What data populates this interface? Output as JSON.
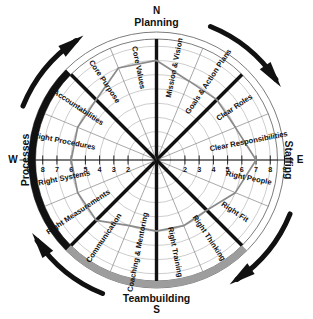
{
  "compass": {
    "north": {
      "cardinal": "N",
      "label": "Planning"
    },
    "east": {
      "cardinal": "E",
      "label": "Staffing"
    },
    "south": {
      "cardinal": "S",
      "label": "Teambuilding"
    },
    "west": {
      "cardinal": "W",
      "label": "Processes"
    }
  },
  "arrows": [
    {
      "name": "planning-to-staffing-arrow",
      "position": "top-right"
    },
    {
      "name": "staffing-to-teambuilding-arrow",
      "position": "right-bottom"
    },
    {
      "name": "teambuilding-to-processes-arrow",
      "position": "bottom-left"
    },
    {
      "name": "processes-to-planning-arrow",
      "position": "left-top"
    }
  ],
  "axis": {
    "left_ticks": [
      "9",
      "8",
      "7",
      "6",
      "5",
      "4",
      "3",
      "2"
    ],
    "right_ticks": [
      "2",
      "3",
      "4",
      "5",
      "6",
      "7",
      "8",
      "9"
    ],
    "scale_min": 1,
    "scale_max": 9
  },
  "emphasis_arcs": [
    {
      "name": "processes-arc",
      "quadrant": "west",
      "color": "#111111"
    },
    {
      "name": "teambuilding-arc",
      "quadrant": "south",
      "color": "#9d9d9d"
    }
  ],
  "chart_data": {
    "type": "radar",
    "xlabel": "",
    "ylabel": "",
    "ylim": [
      0,
      9
    ],
    "grid": true,
    "legend": "none",
    "axis_ranges": {
      "min": 1,
      "max": 9
    },
    "quadrants": [
      "Planning",
      "Staffing",
      "Teambuilding",
      "Processes"
    ],
    "categories": [
      "Mission & Vision",
      "Goals & Action Plans",
      "Clear Roles",
      "Clear Responsibilities",
      "Right People",
      "Right Fit",
      "Right Thinking",
      "Right Training",
      "Coaching & Mentoring",
      "Communication",
      "Right Measurements",
      "Right Systems",
      "Right Procedures",
      "Accountabilities",
      "Core Purpose",
      "Core Values"
    ],
    "values": [
      7,
      6,
      6,
      6,
      7,
      6,
      5,
      5,
      5,
      5,
      6,
      6,
      6,
      6,
      6,
      7
    ],
    "series": [
      {
        "name": "Current Assessment",
        "values": [
          7,
          6,
          6,
          6,
          7,
          6,
          5,
          5,
          5,
          5,
          6,
          6,
          6,
          6,
          6,
          7
        ],
        "color": "#8a8a8a"
      }
    ]
  },
  "sectors": [
    {
      "label": "Mission & Vision",
      "quadrant": "Planning",
      "value": 7
    },
    {
      "label": "Goals & Action Plans",
      "quadrant": "Planning",
      "value": 6
    },
    {
      "label": "Clear Roles",
      "quadrant": "Staffing",
      "value": 6
    },
    {
      "label": "Clear Responsibilities",
      "quadrant": "Staffing",
      "value": 6
    },
    {
      "label": "Right People",
      "quadrant": "Staffing",
      "value": 7
    },
    {
      "label": "Right Fit",
      "quadrant": "Staffing",
      "value": 6
    },
    {
      "label": "Right Thinking",
      "quadrant": "Teambuilding",
      "value": 5
    },
    {
      "label": "Right Training",
      "quadrant": "Teambuilding",
      "value": 5
    },
    {
      "label": "Coaching & Mentoring",
      "quadrant": "Teambuilding",
      "value": 5
    },
    {
      "label": "Communication",
      "quadrant": "Teambuilding",
      "value": 5
    },
    {
      "label": "Right Measurements",
      "quadrant": "Processes",
      "value": 6
    },
    {
      "label": "Right Systems",
      "quadrant": "Processes",
      "value": 6
    },
    {
      "label": "Right Procedures",
      "quadrant": "Processes",
      "value": 6
    },
    {
      "label": "Accountabilities",
      "quadrant": "Processes",
      "value": 6
    },
    {
      "label": "Core Purpose",
      "quadrant": "Planning",
      "value": 6
    },
    {
      "label": "Core Values",
      "quadrant": "Planning",
      "value": 7
    }
  ]
}
